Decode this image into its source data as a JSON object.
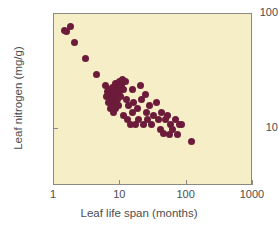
{
  "chart_data": {
    "type": "scatter",
    "title": "",
    "xlabel": "Leaf life span (months)",
    "ylabel": "Leaf nitrogen (mg/g)",
    "xscale": "log",
    "yscale": "log",
    "xlim": [
      1,
      1000
    ],
    "ylim": [
      3.2,
      100
    ],
    "xticks": [
      1,
      10,
      100,
      1000
    ],
    "xticklabels": [
      "1",
      "10",
      "100",
      "1000"
    ],
    "yticks": [
      10,
      100
    ],
    "yticklabels": [
      "10",
      "100"
    ],
    "grid": false,
    "legend": null,
    "marker_color": "#6d1b3a",
    "plot_background": "#f6eec6",
    "figure_background": "#ffffff",
    "points": [
      {
        "x": 1.42,
        "y": 72
      },
      {
        "x": 1.55,
        "y": 70
      },
      {
        "x": 1.78,
        "y": 78
      },
      {
        "x": 2.05,
        "y": 57
      },
      {
        "x": 2.95,
        "y": 41
      },
      {
        "x": 4.3,
        "y": 30
      },
      {
        "x": 6.0,
        "y": 24
      },
      {
        "x": 6.2,
        "y": 19
      },
      {
        "x": 6.5,
        "y": 21
      },
      {
        "x": 6.6,
        "y": 17
      },
      {
        "x": 6.9,
        "y": 22
      },
      {
        "x": 7.0,
        "y": 18
      },
      {
        "x": 7.1,
        "y": 15
      },
      {
        "x": 7.3,
        "y": 20
      },
      {
        "x": 7.5,
        "y": 16
      },
      {
        "x": 7.6,
        "y": 23
      },
      {
        "x": 7.8,
        "y": 19
      },
      {
        "x": 7.9,
        "y": 14
      },
      {
        "x": 8.1,
        "y": 21
      },
      {
        "x": 8.3,
        "y": 17
      },
      {
        "x": 8.5,
        "y": 25
      },
      {
        "x": 8.6,
        "y": 15
      },
      {
        "x": 8.8,
        "y": 20
      },
      {
        "x": 9.0,
        "y": 18
      },
      {
        "x": 9.2,
        "y": 23
      },
      {
        "x": 9.4,
        "y": 16
      },
      {
        "x": 9.6,
        "y": 26
      },
      {
        "x": 9.8,
        "y": 21
      },
      {
        "x": 10.1,
        "y": 19
      },
      {
        "x": 10.4,
        "y": 24
      },
      {
        "x": 10.8,
        "y": 27
      },
      {
        "x": 11.0,
        "y": 22
      },
      {
        "x": 11.3,
        "y": 13
      },
      {
        "x": 11.8,
        "y": 26
      },
      {
        "x": 12.2,
        "y": 18
      },
      {
        "x": 12.8,
        "y": 12
      },
      {
        "x": 13.5,
        "y": 16
      },
      {
        "x": 14.2,
        "y": 11
      },
      {
        "x": 15.0,
        "y": 22
      },
      {
        "x": 15.5,
        "y": 14
      },
      {
        "x": 16.0,
        "y": 17
      },
      {
        "x": 17.0,
        "y": 11
      },
      {
        "x": 18.0,
        "y": 15
      },
      {
        "x": 19.0,
        "y": 12
      },
      {
        "x": 20.0,
        "y": 24
      },
      {
        "x": 21.0,
        "y": 18
      },
      {
        "x": 22.0,
        "y": 11
      },
      {
        "x": 24.0,
        "y": 20
      },
      {
        "x": 25.0,
        "y": 14
      },
      {
        "x": 26.0,
        "y": 12
      },
      {
        "x": 28.0,
        "y": 16
      },
      {
        "x": 30.0,
        "y": 11
      },
      {
        "x": 32.0,
        "y": 13
      },
      {
        "x": 35.0,
        "y": 17
      },
      {
        "x": 37.0,
        "y": 12
      },
      {
        "x": 40.0,
        "y": 10
      },
      {
        "x": 42.0,
        "y": 14
      },
      {
        "x": 45.0,
        "y": 9.2
      },
      {
        "x": 48.0,
        "y": 12
      },
      {
        "x": 52.0,
        "y": 13
      },
      {
        "x": 55.0,
        "y": 9.0
      },
      {
        "x": 58.0,
        "y": 11
      },
      {
        "x": 62.0,
        "y": 10
      },
      {
        "x": 68.0,
        "y": 12
      },
      {
        "x": 72.0,
        "y": 9.0
      },
      {
        "x": 78.0,
        "y": 11
      },
      {
        "x": 85.0,
        "y": 11
      },
      {
        "x": 118.0,
        "y": 7.8
      }
    ]
  }
}
